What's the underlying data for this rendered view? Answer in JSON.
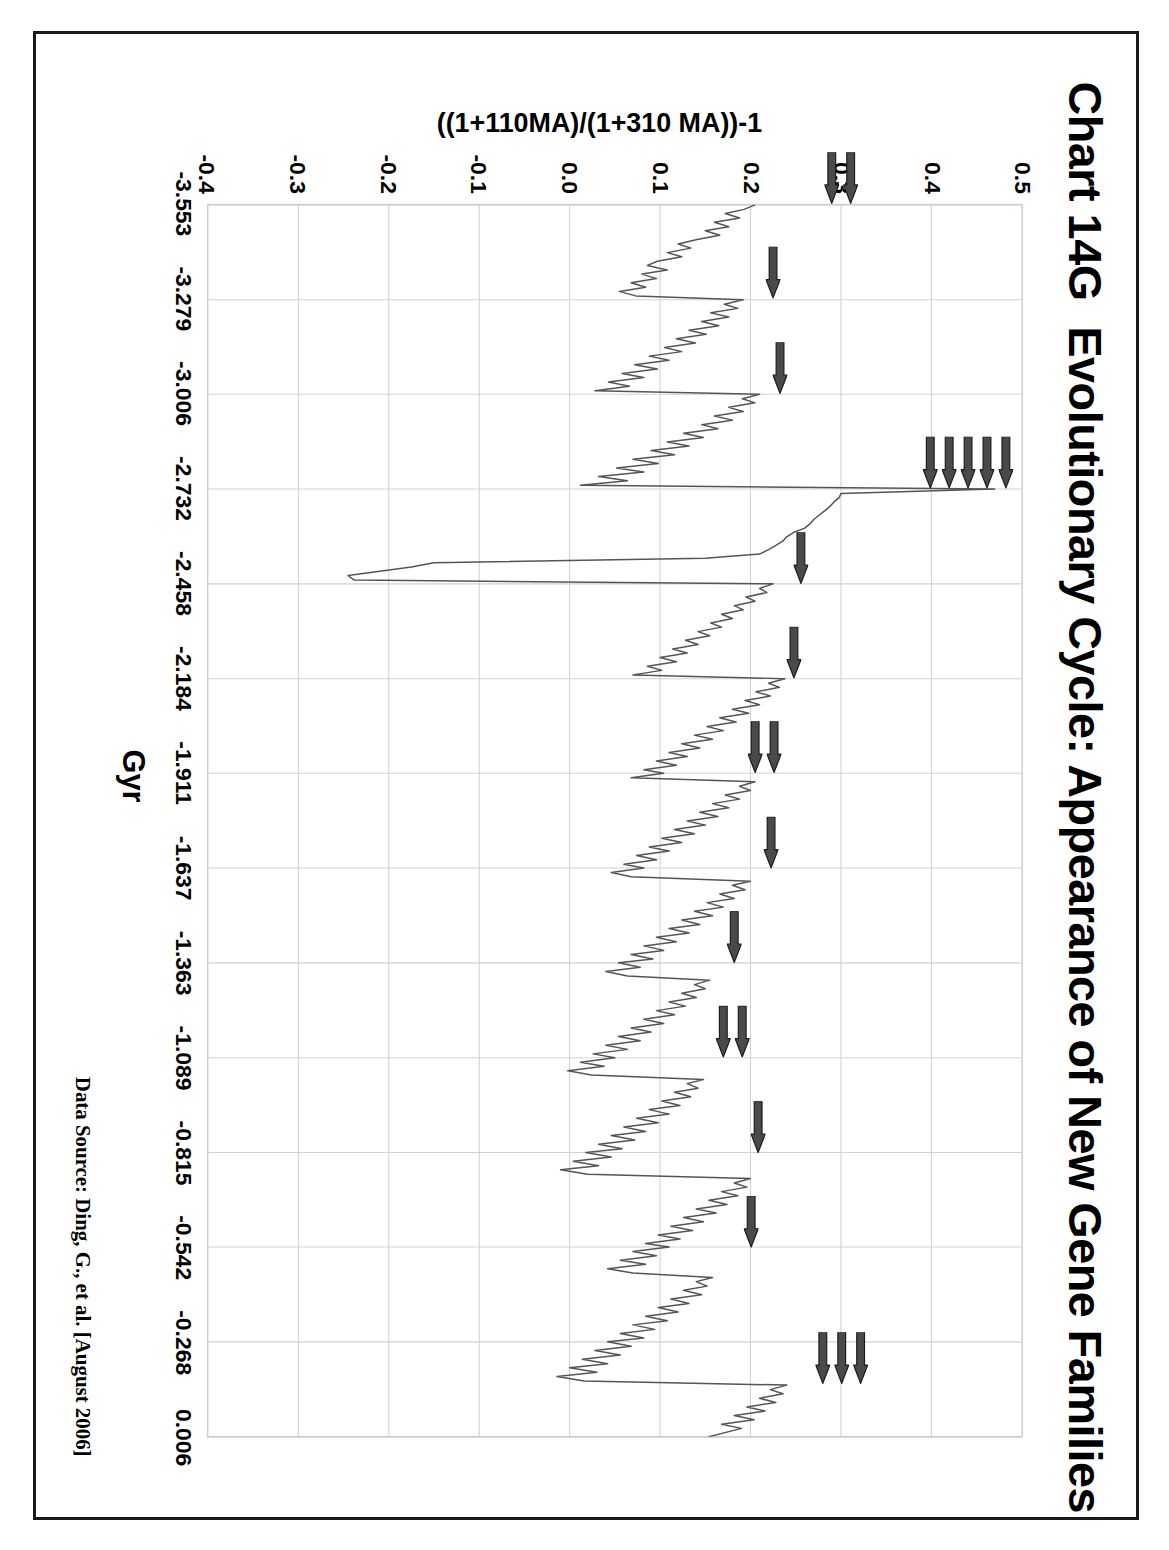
{
  "page": {
    "chart_number": "Chart 14G",
    "title": "Evolutionary Cycle: Appearance of New Gene Families",
    "source_note": "Data Source: Ding, G., et al.  [August 2006]"
  },
  "chart_data": {
    "type": "line",
    "title": "Evolutionary Cycle: Appearance of New Gene Families",
    "xlabel": "Gyr",
    "ylabel": "((1+110MA)/(1+310 MA))-1",
    "xlim": [
      -3.553,
      0.006
    ],
    "ylim": [
      -0.4,
      0.5
    ],
    "grid": true,
    "legend": "none",
    "orientation": "rotated-90",
    "xticks": [
      "-3.553",
      "-3.279",
      "-3.006",
      "-2.732",
      "-2.458",
      "-2.184",
      "-1.911",
      "-1.637",
      "-1.363",
      "-1.089",
      "-0.815",
      "-0.542",
      "-0.268",
      "0.006"
    ],
    "yticks": [
      "0.5",
      "0.4",
      "0.3",
      "0.2",
      "0.1",
      "0.0",
      "-0.1",
      "-0.2",
      "-0.3",
      "-0.4"
    ],
    "ytick_values": [
      0.5,
      0.4,
      0.3,
      0.2,
      0.1,
      0.0,
      -0.1,
      -0.2,
      -0.3,
      -0.4
    ],
    "xtick_values": [
      -3.553,
      -3.279,
      -3.006,
      -2.732,
      -2.458,
      -2.184,
      -1.911,
      -1.637,
      -1.363,
      -1.089,
      -0.815,
      -0.542,
      -0.268,
      0.006
    ],
    "series_name": "Gene family appearance ratio",
    "x": [
      -3.553,
      -3.54,
      -3.528,
      -3.515,
      -3.503,
      -3.49,
      -3.478,
      -3.465,
      -3.453,
      -3.44,
      -3.428,
      -3.415,
      -3.403,
      -3.39,
      -3.378,
      -3.365,
      -3.353,
      -3.34,
      -3.328,
      -3.315,
      -3.303,
      -3.29,
      -3.279,
      -3.266,
      -3.254,
      -3.241,
      -3.229,
      -3.216,
      -3.204,
      -3.191,
      -3.179,
      -3.166,
      -3.154,
      -3.141,
      -3.129,
      -3.116,
      -3.104,
      -3.091,
      -3.079,
      -3.066,
      -3.054,
      -3.041,
      -3.029,
      -3.016,
      -3.006,
      -2.993,
      -2.981,
      -2.968,
      -2.956,
      -2.943,
      -2.931,
      -2.918,
      -2.906,
      -2.893,
      -2.881,
      -2.868,
      -2.856,
      -2.843,
      -2.831,
      -2.818,
      -2.806,
      -2.793,
      -2.781,
      -2.768,
      -2.756,
      -2.743,
      -2.732,
      -2.719,
      -2.707,
      -2.694,
      -2.682,
      -2.669,
      -2.657,
      -2.644,
      -2.632,
      -2.619,
      -2.607,
      -2.594,
      -2.582,
      -2.569,
      -2.557,
      -2.544,
      -2.532,
      -2.519,
      -2.507,
      -2.494,
      -2.482,
      -2.469,
      -2.458,
      -2.445,
      -2.433,
      -2.42,
      -2.408,
      -2.395,
      -2.383,
      -2.37,
      -2.358,
      -2.345,
      -2.333,
      -2.32,
      -2.308,
      -2.295,
      -2.283,
      -2.27,
      -2.258,
      -2.245,
      -2.233,
      -2.22,
      -2.208,
      -2.195,
      -2.184,
      -2.171,
      -2.159,
      -2.146,
      -2.134,
      -2.121,
      -2.109,
      -2.096,
      -2.084,
      -2.071,
      -2.059,
      -2.046,
      -2.034,
      -2.021,
      -2.009,
      -1.996,
      -1.984,
      -1.971,
      -1.959,
      -1.946,
      -1.934,
      -1.921,
      -1.911,
      -1.898,
      -1.886,
      -1.873,
      -1.861,
      -1.848,
      -1.836,
      -1.823,
      -1.811,
      -1.798,
      -1.786,
      -1.773,
      -1.761,
      -1.748,
      -1.736,
      -1.723,
      -1.711,
      -1.698,
      -1.686,
      -1.673,
      -1.661,
      -1.648,
      -1.637,
      -1.624,
      -1.612,
      -1.599,
      -1.587,
      -1.574,
      -1.562,
      -1.549,
      -1.537,
      -1.524,
      -1.512,
      -1.499,
      -1.487,
      -1.474,
      -1.462,
      -1.449,
      -1.437,
      -1.424,
      -1.412,
      -1.399,
      -1.387,
      -1.374,
      -1.363,
      -1.35,
      -1.338,
      -1.325,
      -1.313,
      -1.3,
      -1.288,
      -1.275,
      -1.263,
      -1.25,
      -1.238,
      -1.225,
      -1.213,
      -1.2,
      -1.188,
      -1.175,
      -1.163,
      -1.15,
      -1.138,
      -1.125,
      -1.113,
      -1.1,
      -1.089,
      -1.076,
      -1.064,
      -1.051,
      -1.039,
      -1.026,
      -1.014,
      -1.001,
      -0.989,
      -0.976,
      -0.964,
      -0.951,
      -0.939,
      -0.926,
      -0.914,
      -0.901,
      -0.889,
      -0.876,
      -0.864,
      -0.851,
      -0.839,
      -0.826,
      -0.815,
      -0.802,
      -0.79,
      -0.777,
      -0.765,
      -0.752,
      -0.74,
      -0.727,
      -0.715,
      -0.702,
      -0.69,
      -0.677,
      -0.665,
      -0.652,
      -0.64,
      -0.627,
      -0.615,
      -0.602,
      -0.59,
      -0.577,
      -0.565,
      -0.552,
      -0.542,
      -0.529,
      -0.517,
      -0.504,
      -0.492,
      -0.479,
      -0.467,
      -0.454,
      -0.442,
      -0.429,
      -0.417,
      -0.404,
      -0.392,
      -0.379,
      -0.367,
      -0.354,
      -0.342,
      -0.329,
      -0.317,
      -0.304,
      -0.292,
      -0.279,
      -0.268,
      -0.255,
      -0.243,
      -0.23,
      -0.218,
      -0.205,
      -0.193,
      -0.18,
      -0.168,
      -0.155,
      -0.143,
      -0.13,
      -0.118,
      -0.105,
      -0.093,
      -0.08,
      -0.068,
      -0.055,
      -0.043,
      -0.03,
      -0.018,
      0.006
    ],
    "y": [
      0.205,
      0.193,
      0.172,
      0.188,
      0.16,
      0.176,
      0.15,
      0.166,
      0.141,
      0.12,
      0.134,
      0.108,
      0.124,
      0.097,
      0.086,
      0.108,
      0.08,
      0.096,
      0.068,
      0.084,
      0.055,
      0.073,
      0.192,
      0.171,
      0.186,
      0.156,
      0.176,
      0.146,
      0.165,
      0.132,
      0.151,
      0.118,
      0.139,
      0.105,
      0.124,
      0.088,
      0.11,
      0.072,
      0.097,
      0.058,
      0.082,
      0.043,
      0.066,
      0.028,
      0.21,
      0.191,
      0.205,
      0.176,
      0.192,
      0.16,
      0.18,
      0.146,
      0.164,
      0.126,
      0.148,
      0.108,
      0.132,
      0.09,
      0.116,
      0.07,
      0.098,
      0.052,
      0.082,
      0.032,
      0.064,
      0.012,
      0.47,
      0.3,
      0.298,
      0.292,
      0.288,
      0.282,
      0.276,
      0.27,
      0.266,
      0.26,
      0.248,
      0.24,
      0.236,
      0.228,
      0.22,
      0.21,
      0.15,
      -0.15,
      -0.175,
      -0.212,
      -0.245,
      -0.238,
      0.225,
      0.21,
      0.218,
      0.195,
      0.205,
      0.182,
      0.192,
      0.168,
      0.18,
      0.156,
      0.168,
      0.142,
      0.155,
      0.128,
      0.142,
      0.114,
      0.13,
      0.1,
      0.118,
      0.086,
      0.102,
      0.07,
      0.238,
      0.22,
      0.232,
      0.206,
      0.222,
      0.194,
      0.21,
      0.18,
      0.198,
      0.166,
      0.184,
      0.152,
      0.17,
      0.138,
      0.158,
      0.124,
      0.144,
      0.11,
      0.13,
      0.096,
      0.118,
      0.082,
      0.104,
      0.068,
      0.205,
      0.188,
      0.2,
      0.172,
      0.188,
      0.158,
      0.176,
      0.144,
      0.164,
      0.13,
      0.15,
      0.116,
      0.138,
      0.102,
      0.124,
      0.088,
      0.11,
      0.074,
      0.096,
      0.06,
      0.082,
      0.046,
      0.068,
      0.2,
      0.18,
      0.194,
      0.166,
      0.182,
      0.152,
      0.17,
      0.138,
      0.158,
      0.124,
      0.144,
      0.11,
      0.132,
      0.096,
      0.118,
      0.082,
      0.104,
      0.068,
      0.092,
      0.054,
      0.078,
      0.04,
      0.064,
      0.155,
      0.138,
      0.15,
      0.124,
      0.14,
      0.11,
      0.128,
      0.096,
      0.116,
      0.082,
      0.104,
      0.068,
      0.09,
      0.054,
      0.078,
      0.04,
      0.064,
      0.026,
      0.05,
      0.012,
      0.038,
      -0.002,
      0.024,
      0.148,
      0.13,
      0.142,
      0.116,
      0.134,
      0.102,
      0.122,
      0.088,
      0.11,
      0.074,
      0.098,
      0.06,
      0.084,
      0.046,
      0.072,
      0.032,
      0.058,
      0.018,
      0.046,
      0.004,
      0.032,
      -0.01,
      0.02,
      0.2,
      0.182,
      0.196,
      0.168,
      0.186,
      0.154,
      0.174,
      0.14,
      0.162,
      0.126,
      0.148,
      0.112,
      0.136,
      0.098,
      0.122,
      0.084,
      0.11,
      0.07,
      0.096,
      0.056,
      0.084,
      0.042,
      0.07,
      0.158,
      0.14,
      0.152,
      0.126,
      0.146,
      0.112,
      0.132,
      0.098,
      0.12,
      0.084,
      0.108,
      0.07,
      0.094,
      0.056,
      0.082,
      0.042,
      0.068,
      0.028,
      0.056,
      0.014,
      0.042,
      0.0,
      0.03,
      -0.014,
      0.016,
      0.24,
      0.222,
      0.236,
      0.21,
      0.228,
      0.196,
      0.216,
      0.182,
      0.204,
      0.168,
      0.19,
      0.154,
      0.178,
      0.14,
      0.166,
      0.126,
      0.152,
      0.112,
      0.14,
      0.098,
      0.126,
      0.084,
      0.114,
      0.15
    ]
  },
  "annotations": {
    "arrow_label": "cycle-peak-marker",
    "arrow_color": "#4a4a4a",
    "clusters": [
      {
        "x": -3.553,
        "count": 2,
        "y_at": 0.3
      },
      {
        "x": -3.279,
        "count": 1,
        "y_at": 0.225
      },
      {
        "x": -3.006,
        "count": 1,
        "y_at": 0.232
      },
      {
        "x": -2.732,
        "count": 5,
        "y_at": 0.44
      },
      {
        "x": -2.458,
        "count": 1,
        "y_at": 0.255
      },
      {
        "x": -2.184,
        "count": 1,
        "y_at": 0.248
      },
      {
        "x": -1.911,
        "count": 2,
        "y_at": 0.215
      },
      {
        "x": -1.637,
        "count": 1,
        "y_at": 0.222
      },
      {
        "x": -1.363,
        "count": 1,
        "y_at": 0.182
      },
      {
        "x": -1.089,
        "count": 2,
        "y_at": 0.18
      },
      {
        "x": -0.815,
        "count": 1,
        "y_at": 0.208
      },
      {
        "x": -0.542,
        "count": 1,
        "y_at": 0.2
      },
      {
        "x": -0.15,
        "count": 3,
        "y_at": 0.3
      }
    ]
  }
}
